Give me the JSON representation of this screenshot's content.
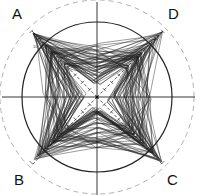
{
  "diagram": {
    "type": "radar-web",
    "center": [
      97,
      97
    ],
    "inner_circle_radius": 75,
    "outer_dashed_circle_radius": 97,
    "labels": {
      "A": "A",
      "B": "B",
      "C": "C",
      "D": "D"
    },
    "tick_label": "10",
    "axes": [
      {
        "name": "A",
        "direction": "top-left"
      },
      {
        "name": "D",
        "direction": "top-right"
      },
      {
        "name": "B",
        "direction": "bottom-left"
      },
      {
        "name": "C",
        "direction": "bottom-right"
      }
    ],
    "colors": {
      "lines": "#222222",
      "dashed_circle": "#aaaaaa",
      "background": "#ffffff"
    }
  }
}
